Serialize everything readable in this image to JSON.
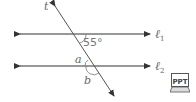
{
  "diagram": {
    "transversal_label": "t",
    "line1_label": "ℓ1",
    "line2_label": "ℓ2",
    "line1_sub": "1",
    "line2_sub": "2",
    "line_letter": "ℓ",
    "angle_given": "55°",
    "angle_a": "a",
    "angle_b": "b",
    "ppt_icon_label": "PPT"
  },
  "colors": {
    "line": "#333333",
    "label": "#666666"
  }
}
